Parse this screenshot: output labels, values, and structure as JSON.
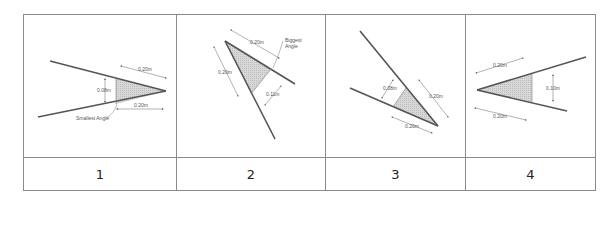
{
  "table": {
    "columns": [
      {
        "label": "1",
        "dimensions": [
          "0.20m",
          "0.08m",
          "0.20m"
        ],
        "annotation": "Smallest Angle"
      },
      {
        "label": "2",
        "dimensions": [
          "0.20m",
          "0.20m",
          "0.11m"
        ],
        "annotation": "Biggest Angle"
      },
      {
        "label": "3",
        "dimensions": [
          "0.08m",
          "0.20m",
          "0.20m"
        ],
        "annotation": ""
      },
      {
        "label": "4",
        "dimensions": [
          "0.20m",
          "0.10m",
          "0.20m"
        ],
        "annotation": ""
      }
    ]
  },
  "colors": {
    "line": "#555555",
    "border": "#888888",
    "shade": "#cfcfcf"
  }
}
